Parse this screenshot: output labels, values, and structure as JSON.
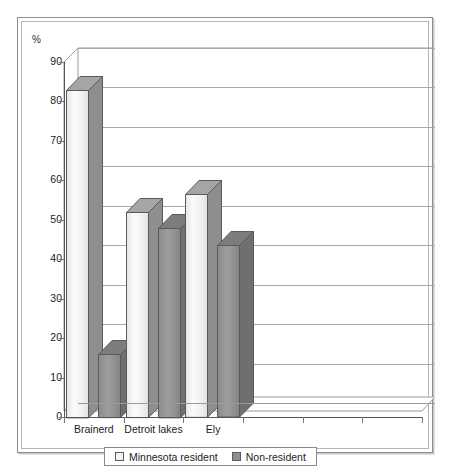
{
  "chart_data": {
    "type": "bar",
    "title": "",
    "subtitle": "",
    "xlabel": "",
    "ylabel": "%",
    "ylim": [
      0,
      90
    ],
    "ytick_step": 10,
    "yticks": [
      0,
      10,
      20,
      30,
      40,
      50,
      60,
      70,
      80,
      90
    ],
    "grid": true,
    "style_3d": true,
    "legend_position": "bottom",
    "x_slot_count": 6,
    "categories": [
      "Brainerd",
      "Detroit lakes",
      "Ely"
    ],
    "series": [
      {
        "name": "Minnesota resident",
        "color": "#f4f4f4",
        "values": [
          83,
          52,
          56.5
        ]
      },
      {
        "name": "Non-resident",
        "color": "#8f8f8f",
        "values": [
          16,
          48,
          43.5
        ]
      }
    ]
  },
  "axis": {
    "y_title": "%",
    "tick_labels": [
      "90",
      "80",
      "70",
      "60",
      "50",
      "40",
      "30",
      "20",
      "10",
      "0"
    ]
  },
  "legend": {
    "entries": [
      {
        "label": "Minnesota resident",
        "swatch": "light"
      },
      {
        "label": "Non-resident",
        "swatch": "dark"
      }
    ]
  }
}
